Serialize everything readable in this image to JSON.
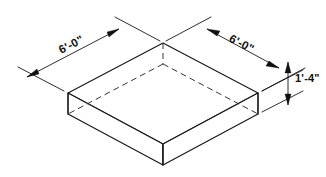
{
  "drawing": {
    "type": "isometric-technical-drawing",
    "subject": "rectangular concrete slab",
    "background_color": "#ffffff",
    "line_color": "#171717",
    "hidden_line_style": "dashed",
    "dimensions": [
      {
        "id": "left-width",
        "label": "6'-0\"",
        "orientation": "upper-left-diagonal",
        "rotation_deg": -27.5
      },
      {
        "id": "right-width",
        "label": "6'-0\"",
        "orientation": "upper-right-diagonal",
        "rotation_deg": 27.5
      },
      {
        "id": "thickness",
        "label": "1'-4\"",
        "orientation": "vertical-right",
        "rotation_deg": 0
      }
    ],
    "geometry": {
      "top_face_vertices": "68,93 163,43 258,93 163,144",
      "bottom_front_vertex": "163,165",
      "bottom_left_vertex": "68,114",
      "bottom_right_vertex": "258,114",
      "slab_height_px": 21
    }
  }
}
